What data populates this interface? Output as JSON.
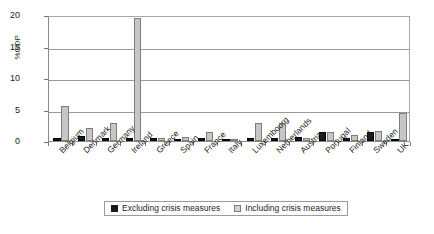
{
  "chart_data": {
    "type": "bar",
    "title": "",
    "xlabel": "",
    "ylabel": "%GDP",
    "ylim": [
      0,
      20
    ],
    "yticks": [
      0,
      5,
      10,
      15,
      20
    ],
    "grid": true,
    "legend_position": "bottom",
    "categories": [
      "Belgium",
      "Denmark",
      "Germany",
      "Ireland",
      "Greece",
      "Spain",
      "France",
      "Italy",
      "Luxembourg",
      "Netherlands",
      "Austria",
      "Portugal",
      "Finland",
      "Sweden",
      "UK"
    ],
    "series": [
      {
        "name": "Excluding crisis measures",
        "color": "#1a1a1a",
        "values": [
          0.4,
          0.8,
          0.4,
          0.4,
          0.4,
          0.3,
          0.5,
          0.3,
          0.5,
          0.5,
          0.7,
          1.4,
          0.5,
          1.5,
          0.2
        ]
      },
      {
        "name": "Including crisis measures",
        "color": "#c6c6c6",
        "values": [
          5.6,
          2.0,
          2.8,
          19.6,
          0.4,
          0.6,
          1.4,
          0.3,
          2.9,
          2.9,
          0.5,
          1.5,
          0.9,
          1.6,
          4.4
        ]
      }
    ]
  },
  "axis": {
    "y_title": "%GDP",
    "y_tick_labels": [
      "0",
      "5",
      "10",
      "15",
      "20"
    ]
  },
  "legend": {
    "items": [
      {
        "label": "Excluding crisis measures",
        "swatch": "legend-swatch-excluding"
      },
      {
        "label": "Including crisis measures",
        "swatch": "legend-swatch-including"
      }
    ]
  }
}
